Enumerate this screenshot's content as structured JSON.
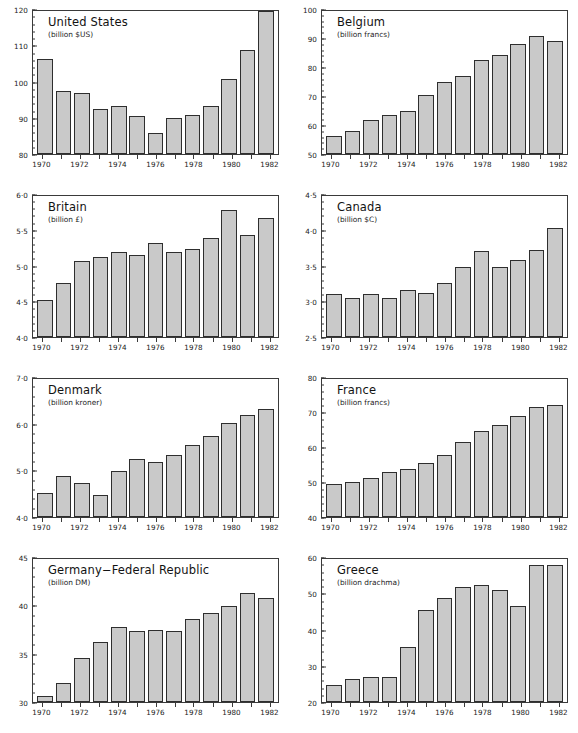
{
  "figure": {
    "layout": "2 columns x 4 rows of small-multiple bar charts",
    "panel_count": 8,
    "bar_fill_color": "#c9c9c9",
    "axis_color": "#3a3a3a",
    "background": "#ffffff"
  },
  "chart_data": [
    {
      "type": "bar",
      "title": "United States",
      "subtitle": "(billion $US)",
      "xlabel": "",
      "ylabel": "billion $US",
      "grid": false,
      "legend": null,
      "ylim": [
        80,
        120
      ],
      "yticks": [
        80,
        90,
        100,
        110,
        120
      ],
      "ytick_labels": [
        "80",
        "90",
        "100",
        "110",
        "120"
      ],
      "yminor_step": 2,
      "categories": [
        1970,
        1971,
        1972,
        1973,
        1974,
        1975,
        1976,
        1977,
        1978,
        1979,
        1980,
        1981,
        1982
      ],
      "xtick_labels": [
        "1970",
        "",
        "1972",
        "",
        "1974",
        "",
        "1976",
        "",
        "1978",
        "",
        "1980",
        "",
        "1982"
      ],
      "values": [
        106.7,
        97.5,
        97.2,
        92.7,
        93.5,
        90.6,
        86.0,
        90.2,
        90.8,
        93.5,
        100.9,
        109.1,
        120.0
      ]
    },
    {
      "type": "bar",
      "title": "Belgium",
      "subtitle": "(billion francs)",
      "xlabel": "",
      "ylabel": "billion francs",
      "grid": false,
      "legend": null,
      "ylim": [
        50,
        100
      ],
      "yticks": [
        50,
        60,
        70,
        80,
        90,
        100
      ],
      "ytick_labels": [
        "50",
        "60",
        "70",
        "80",
        "90",
        "100"
      ],
      "yminor_step": 2,
      "categories": [
        1970,
        1971,
        1972,
        1973,
        1974,
        1975,
        1976,
        1977,
        1978,
        1979,
        1980,
        1981,
        1982
      ],
      "xtick_labels": [
        "1970",
        "",
        "1972",
        "",
        "1974",
        "",
        "1976",
        "",
        "1978",
        "",
        "1980",
        "",
        "1982"
      ],
      "values": [
        56.3,
        58.2,
        62.0,
        63.7,
        64.9,
        70.8,
        75.3,
        77.4,
        82.8,
        84.7,
        88.4,
        91.4,
        89.6
      ]
    },
    {
      "type": "bar",
      "title": "Britain",
      "subtitle": "(billion £)",
      "xlabel": "",
      "ylabel": "billion £",
      "grid": false,
      "legend": null,
      "ylim": [
        4.0,
        6.0
      ],
      "yticks": [
        4.0,
        4.5,
        5.0,
        5.5,
        6.0
      ],
      "ytick_labels": [
        "4·0",
        "4·5",
        "5·0",
        "5·5",
        "6·0"
      ],
      "yminor_step": 0.1,
      "categories": [
        1970,
        1971,
        1972,
        1973,
        1974,
        1975,
        1976,
        1977,
        1978,
        1979,
        1980,
        1981,
        1982
      ],
      "xtick_labels": [
        "1970",
        "",
        "1972",
        "",
        "1974",
        "",
        "1976",
        "",
        "1978",
        "",
        "1980",
        "",
        "1982"
      ],
      "values": [
        4.53,
        4.77,
        5.08,
        5.13,
        5.21,
        5.17,
        5.34,
        5.21,
        5.25,
        5.41,
        5.8,
        5.44,
        5.69
      ]
    },
    {
      "type": "bar",
      "title": "Canada",
      "subtitle": "(billion $C)",
      "xlabel": "",
      "ylabel": "billion $C",
      "grid": false,
      "legend": null,
      "ylim": [
        2.5,
        4.5
      ],
      "yticks": [
        2.5,
        3.0,
        3.5,
        4.0,
        4.5
      ],
      "ytick_labels": [
        "2·5",
        "3·0",
        "3·5",
        "4·0",
        "4·5"
      ],
      "yminor_step": 0.1,
      "categories": [
        1970,
        1971,
        1972,
        1973,
        1974,
        1975,
        1976,
        1977,
        1978,
        1979,
        1980,
        1981,
        1982
      ],
      "xtick_labels": [
        "1970",
        "",
        "1972",
        "",
        "1974",
        "",
        "1976",
        "",
        "1978",
        "",
        "1980",
        "",
        "1982"
      ],
      "values": [
        3.11,
        3.06,
        3.11,
        3.06,
        3.16,
        3.12,
        3.26,
        3.5,
        3.72,
        3.49,
        3.59,
        3.74,
        4.05
      ]
    },
    {
      "type": "bar",
      "title": "Denmark",
      "subtitle": "(billion kroner)",
      "xlabel": "",
      "ylabel": "billion kroner",
      "grid": false,
      "legend": null,
      "ylim": [
        4.0,
        7.0
      ],
      "yticks": [
        4.0,
        5.0,
        6.0,
        7.0
      ],
      "ytick_labels": [
        "4·0",
        "5·0",
        "6·0",
        "7·0"
      ],
      "yminor_step": 0.2,
      "categories": [
        1970,
        1971,
        1972,
        1973,
        1974,
        1975,
        1976,
        1977,
        1978,
        1979,
        1980,
        1981,
        1982
      ],
      "xtick_labels": [
        "1970",
        "",
        "1972",
        "",
        "1974",
        "",
        "1976",
        "",
        "1978",
        "",
        "1980",
        "",
        "1982"
      ],
      "values": [
        4.52,
        4.89,
        4.75,
        4.47,
        5.01,
        5.27,
        5.2,
        5.34,
        5.56,
        5.76,
        6.04,
        6.22,
        6.35
      ]
    },
    {
      "type": "bar",
      "title": "France",
      "subtitle": "(billion francs)",
      "xlabel": "",
      "ylabel": "billion francs",
      "grid": false,
      "legend": null,
      "ylim": [
        40,
        80
      ],
      "yticks": [
        40,
        50,
        60,
        70,
        80
      ],
      "ytick_labels": [
        "40",
        "50",
        "60",
        "70",
        "80"
      ],
      "yminor_step": 2,
      "categories": [
        1970,
        1971,
        1972,
        1973,
        1974,
        1975,
        1976,
        1977,
        1978,
        1979,
        1980,
        1981,
        1982
      ],
      "xtick_labels": [
        "1970",
        "",
        "1972",
        "",
        "1974",
        "",
        "1976",
        "",
        "1978",
        "",
        "1980",
        "",
        "1982"
      ],
      "values": [
        49.5,
        50.2,
        51.4,
        53.0,
        54.0,
        55.6,
        57.9,
        61.6,
        64.8,
        66.6,
        69.2,
        71.8,
        72.5
      ]
    },
    {
      "type": "bar",
      "title": "Germany−Federal Republic",
      "subtitle": "(billion DM)",
      "xlabel": "",
      "ylabel": "billion DM",
      "grid": false,
      "legend": null,
      "ylim": [
        30,
        45
      ],
      "yticks": [
        30,
        35,
        40,
        45
      ],
      "ytick_labels": [
        "30",
        "35",
        "40",
        "45"
      ],
      "yminor_step": 1,
      "categories": [
        1970,
        1971,
        1972,
        1973,
        1974,
        1975,
        1976,
        1977,
        1978,
        1979,
        1980,
        1981,
        1982
      ],
      "xtick_labels": [
        "1970",
        "",
        "1972",
        "",
        "1974",
        "",
        "1976",
        "",
        "1978",
        "",
        "1980",
        "",
        "1982"
      ],
      "values": [
        30.6,
        32.0,
        34.6,
        36.3,
        37.9,
        37.5,
        37.6,
        37.4,
        38.7,
        39.3,
        40.1,
        41.4,
        40.9
      ]
    },
    {
      "type": "bar",
      "title": "Greece",
      "subtitle": "(billion drachma)",
      "xlabel": "",
      "ylabel": "billion drachma",
      "grid": false,
      "legend": null,
      "ylim": [
        20,
        60
      ],
      "yticks": [
        20,
        30,
        40,
        50,
        60
      ],
      "ytick_labels": [
        "20",
        "30",
        "40",
        "50",
        "60"
      ],
      "yminor_step": 2,
      "categories": [
        1970,
        1971,
        1972,
        1973,
        1974,
        1975,
        1976,
        1977,
        1978,
        1979,
        1980,
        1981,
        1982
      ],
      "xtick_labels": [
        "1970",
        "",
        "1972",
        "",
        "1974",
        "",
        "1976",
        "",
        "1978",
        "",
        "1980",
        "",
        "1982"
      ],
      "values": [
        24.7,
        26.3,
        27.1,
        27.0,
        35.3,
        45.7,
        49.2,
        52.1,
        52.8,
        51.4,
        46.9,
        58.4,
        58.3
      ]
    }
  ]
}
